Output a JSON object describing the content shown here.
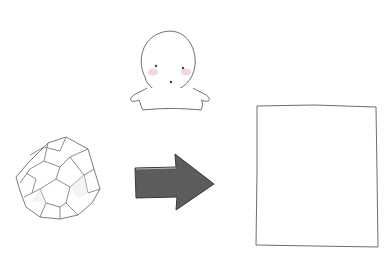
{
  "illustration": {
    "description": "Hand-drawn sketch: crumpled paper ball, arrow pointing right, flat blank sheet, with a small round-headed character above",
    "elements": [
      {
        "name": "character",
        "icon": "round-head-character-icon"
      },
      {
        "name": "crumpled-paper",
        "icon": "crumpled-paper-ball-icon"
      },
      {
        "name": "arrow",
        "icon": "arrow-right-icon",
        "fill": "#5a5a5a"
      },
      {
        "name": "blank-sheet",
        "icon": "blank-paper-sheet-icon"
      }
    ],
    "colors": {
      "line": "#6e6e6e",
      "arrow_fill": "#5a5a5a",
      "cheek": "#f2d8d8",
      "background": "#ffffff"
    }
  }
}
